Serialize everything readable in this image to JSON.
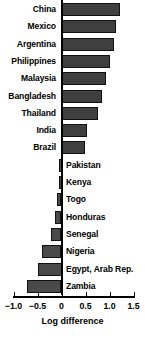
{
  "chart_data": {
    "type": "bar",
    "orientation": "horizontal",
    "title": "",
    "xlabel": "Log difference",
    "ylabel": "",
    "xlim": [
      -1.0,
      1.5
    ],
    "ylim": null,
    "grid": false,
    "legend": null,
    "xticks": [
      -1.0,
      -0.5,
      0,
      0.5,
      1.0,
      1.5
    ],
    "xtick_labels": [
      "-1.0",
      "-0.5",
      "0",
      "0.5",
      "1.0",
      "1.5"
    ],
    "categories": [
      "China",
      "Mexico",
      "Argentina",
      "Philippines",
      "Malaysia",
      "Bangladesh",
      "Thailand",
      "India",
      "Brazil",
      "Pakistan",
      "Kenya",
      "Togo",
      "Honduras",
      "Senegal",
      "Nigeria",
      "Egypt, Arab Rep.",
      "Zambia"
    ],
    "values": [
      1.21,
      1.13,
      1.09,
      1.0,
      0.92,
      0.85,
      0.77,
      0.54,
      0.48,
      -0.03,
      -0.05,
      -0.1,
      -0.13,
      -0.21,
      -0.4,
      -0.5,
      -0.71
    ],
    "bar_color": "#3f3f3f",
    "bar_edge_color": "#111111",
    "axis_color": "#000000",
    "background_color": "#ffffff"
  }
}
